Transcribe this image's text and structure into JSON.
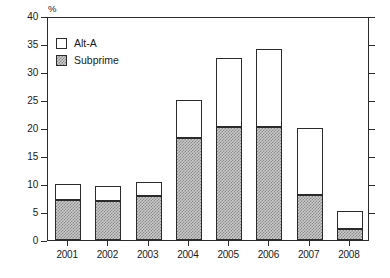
{
  "chart_data": {
    "type": "bar",
    "subtype": "stacked-vertical",
    "title": "",
    "xlabel": "",
    "ylabel": "%",
    "ylim": [
      0,
      40
    ],
    "ytick_step": 5,
    "yticks": [
      0,
      5,
      10,
      15,
      20,
      25,
      30,
      35,
      40
    ],
    "ytick_labels": [
      "0",
      "5",
      "10",
      "15",
      "20",
      "25",
      "30",
      "35",
      "40"
    ],
    "grid": true,
    "grid_style": "dotted",
    "legend_position": "inside-top-left",
    "categories": [
      "2001",
      "2002",
      "2003",
      "2004",
      "2005",
      "2006",
      "2007",
      "2008"
    ],
    "series": [
      {
        "name": "Subprime",
        "fill": "gray-hatched",
        "color": "#c9c9c9",
        "values": [
          7.2,
          7.0,
          7.9,
          18.3,
          20.2,
          20.2,
          8.0,
          2.0
        ]
      },
      {
        "name": "Alt-A",
        "fill": "white",
        "color": "#ffffff",
        "values": [
          2.6,
          2.4,
          2.2,
          6.4,
          12.1,
          13.6,
          11.7,
          3.0
        ]
      }
    ],
    "totals": [
      9.8,
      9.4,
      10.1,
      24.7,
      32.3,
      33.8,
      19.7,
      5.0
    ]
  },
  "legend": {
    "items": [
      {
        "label": "Alt-A",
        "swatch": "white-square"
      },
      {
        "label": "Subprime",
        "swatch": "gray-hatched-square"
      }
    ]
  },
  "axis": {
    "y_unit_label": "%"
  },
  "colors": {
    "frame": "#2b2b2b",
    "gridline": "#9a9a9a",
    "subprime_fill": "#c9c9c9",
    "subprime_hatch": "#8c8c8c",
    "alta_fill": "#ffffff",
    "text": "#1a1a1a"
  }
}
